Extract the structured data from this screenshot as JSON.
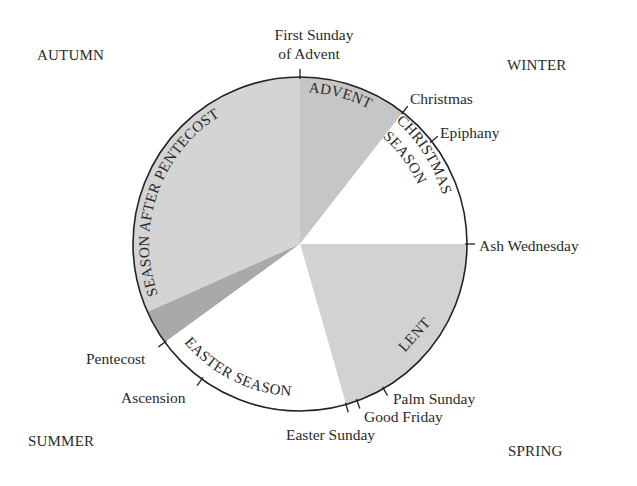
{
  "geometry": {
    "cx": 300,
    "cy": 244,
    "r": 167
  },
  "colors": {
    "advent": "#c6c6c6",
    "christmas_season": "#ffffff",
    "lent": "#d2d2d2",
    "easter_season": "#ffffff",
    "pentecost": "#a9a9a9",
    "season_after_pentecost": "#d4d4d4",
    "outline": "#222222"
  },
  "corners": {
    "autumn": "AUTUMN",
    "winter": "WINTER",
    "summer": "SUMMER",
    "spring": "SPRING"
  },
  "seasons": [
    {
      "id": "advent",
      "label": "ADVENT",
      "start": 0,
      "end": 38
    },
    {
      "id": "christmas_season",
      "label_line1": "CHRISTMAS",
      "label_line2": "SEASON",
      "start": 38,
      "end": 90
    },
    {
      "id": "lent",
      "label": "LENT",
      "start": 90,
      "end": 164
    },
    {
      "id": "easter_season",
      "label": "EASTER SEASON",
      "start": 164,
      "end": 234
    },
    {
      "id": "pentecost",
      "label": "",
      "start": 234,
      "end": 246
    },
    {
      "id": "season_after_pentecost",
      "label": "SEASON AFTER PENTECOST",
      "start": 246,
      "end": 360
    }
  ],
  "events": {
    "first_sunday_of_advent": {
      "line1": "First Sunday",
      "line2": "of Advent",
      "angle": 0
    },
    "christmas": {
      "label": "Christmas",
      "angle": 38
    },
    "epiphany": {
      "label": "Epiphany",
      "angle": 52
    },
    "ash_wednesday": {
      "label": "Ash Wednesday",
      "angle": 90
    },
    "palm_sunday": {
      "label": "Palm Sunday",
      "angle": 150
    },
    "good_friday": {
      "label": "Good Friday",
      "angle": 160
    },
    "easter_sunday": {
      "label": "Easter Sunday",
      "angle": 164
    },
    "ascension": {
      "label": "Ascension",
      "angle": 216
    },
    "pentecost": {
      "label": "Pentecost",
      "angle": 234
    }
  }
}
